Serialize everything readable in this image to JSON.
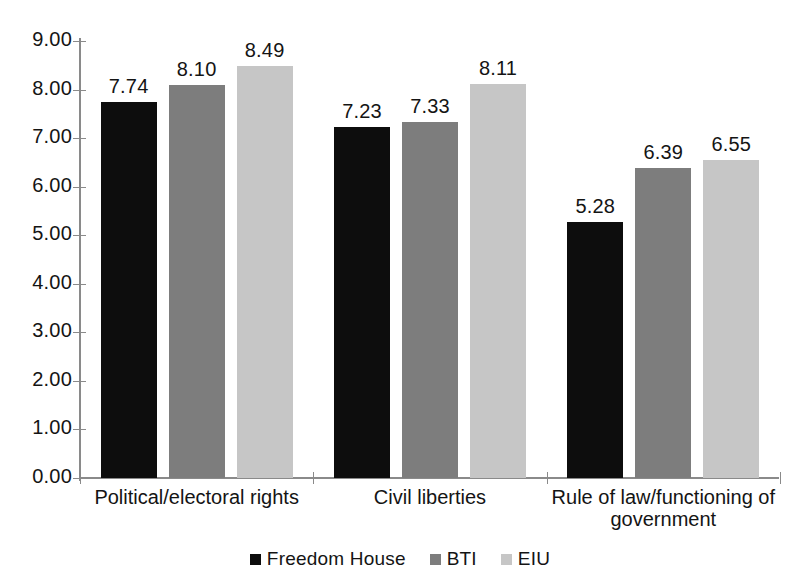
{
  "chart_data": {
    "type": "bar",
    "title": "",
    "subtitle": "",
    "xlabel": "",
    "ylabel": "",
    "ylim": [
      0,
      9
    ],
    "ytick_step": 1,
    "ytick_labels": [
      "0.00",
      "1.00",
      "2.00",
      "3.00",
      "4.00",
      "5.00",
      "6.00",
      "7.00",
      "8.00",
      "9.00"
    ],
    "grid": false,
    "legend_position": "bottom",
    "categories": [
      "Political/electoral rights",
      "Civil liberties",
      "Rule of law/functioning of\ngovernment"
    ],
    "series": [
      {
        "name": "Freedom House",
        "color": "#0d0d0d",
        "values": [
          7.74,
          7.23,
          5.28
        ],
        "labels": [
          "7.74",
          "7.23",
          "5.28"
        ]
      },
      {
        "name": "BTI",
        "color": "#7d7d7d",
        "values": [
          8.1,
          7.33,
          6.39
        ],
        "labels": [
          "8.10",
          "7.33",
          "6.39"
        ]
      },
      {
        "name": "EIU",
        "color": "#c6c6c6",
        "values": [
          8.49,
          8.11,
          6.55
        ],
        "labels": [
          "8.49",
          "8.11",
          "6.55"
        ]
      }
    ]
  },
  "axis": {
    "axis_color": "#8a8a8a"
  },
  "legend": {
    "items": [
      {
        "label": "Freedom House",
        "color": "#0d0d0d"
      },
      {
        "label": "BTI",
        "color": "#7d7d7d"
      },
      {
        "label": "EIU",
        "color": "#c6c6c6"
      }
    ]
  }
}
